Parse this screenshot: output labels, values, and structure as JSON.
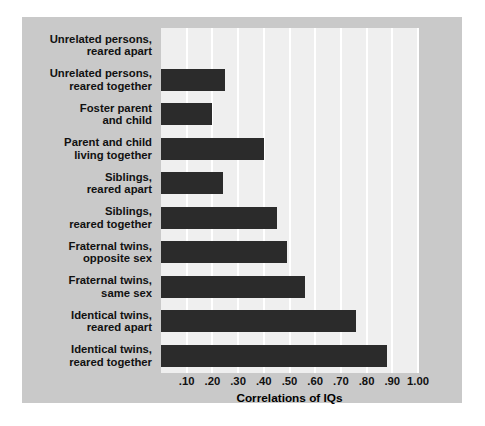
{
  "chart_data": {
    "type": "bar",
    "orientation": "horizontal",
    "title": "",
    "xlabel": "Correlations of IQs",
    "ylabel": "",
    "xlim": [
      0.0,
      1.0
    ],
    "grid": true,
    "legend": null,
    "bar_color": "#2b2b2b",
    "plot_background": "#efefef",
    "figure_background": "#c9c9c9",
    "xticks": [
      ".10",
      ".20",
      ".30",
      ".40",
      ".50",
      ".60",
      ".70",
      ".80",
      ".90",
      "1.00"
    ],
    "xtick_values": [
      0.1,
      0.2,
      0.3,
      0.4,
      0.5,
      0.6,
      0.7,
      0.8,
      0.9,
      1.0
    ],
    "categories": [
      "Unrelated persons,\nreared apart",
      "Unrelated persons,\nreared together",
      "Foster parent\nand child",
      "Parent and child\nliving together",
      "Siblings,\nreared apart",
      "Siblings,\nreared together",
      "Fraternal twins,\nopposite sex",
      "Fraternal twins,\nsame sex",
      "Identical twins,\nreared apart",
      "Identical twins,\nreared together"
    ],
    "values": [
      0.0,
      0.25,
      0.2,
      0.4,
      0.24,
      0.45,
      0.49,
      0.56,
      0.76,
      0.88
    ],
    "rows": [
      {
        "line1": "Unrelated persons,",
        "line2": "reared apart",
        "value": 0.0
      },
      {
        "line1": "Unrelated persons,",
        "line2": "reared together",
        "value": 0.25
      },
      {
        "line1": "Foster parent",
        "line2": "and child",
        "value": 0.2
      },
      {
        "line1": "Parent and child",
        "line2": "living together",
        "value": 0.4
      },
      {
        "line1": "Siblings,",
        "line2": "reared apart",
        "value": 0.24
      },
      {
        "line1": "Siblings,",
        "line2": "reared together",
        "value": 0.45
      },
      {
        "line1": "Fraternal twins,",
        "line2": "opposite sex",
        "value": 0.49
      },
      {
        "line1": "Fraternal twins,",
        "line2": "same sex",
        "value": 0.56
      },
      {
        "line1": "Identical twins,",
        "line2": "reared apart",
        "value": 0.76
      },
      {
        "line1": "Identical twins,",
        "line2": "reared together",
        "value": 0.88
      }
    ]
  }
}
